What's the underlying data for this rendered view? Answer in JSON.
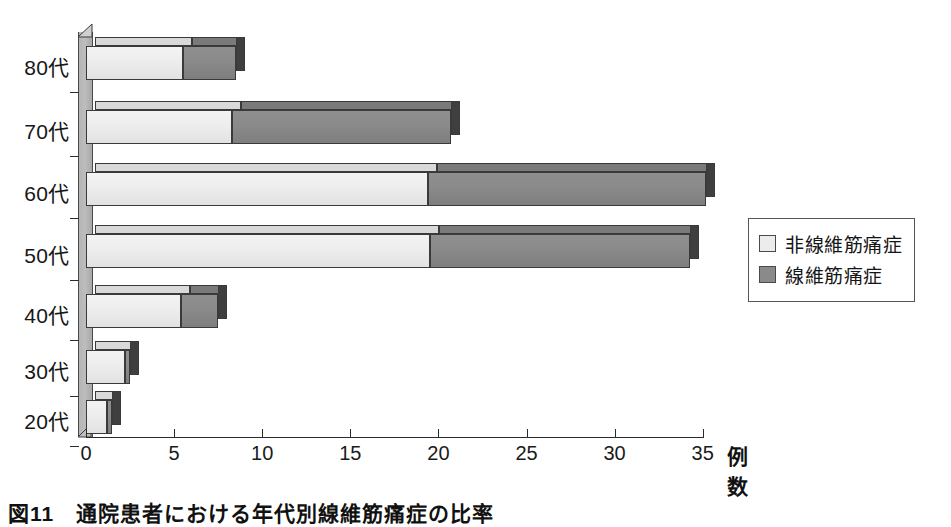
{
  "figure": {
    "caption": "図11　通院患者における年代別線維筋痛症の比率"
  },
  "legend": {
    "position": "right",
    "items": [
      {
        "label": "非線維筋痛症",
        "color": "#ececec",
        "swatch": "light-square-icon"
      },
      {
        "label": "線維筋痛症",
        "color": "#8a8a8a",
        "swatch": "dark-square-icon"
      }
    ]
  },
  "axes": {
    "x_title": "例数",
    "x_ticks": [
      "0",
      "5",
      "10",
      "15",
      "20",
      "25",
      "30",
      "35"
    ],
    "y_labels": [
      "80代",
      "70代",
      "60代",
      "50代",
      "40代",
      "30代",
      "20代"
    ]
  },
  "chart_data": {
    "type": "bar",
    "orientation": "horizontal",
    "stacked": true,
    "title": "図11　通院患者における年代別線維筋痛症の比率",
    "xlabel": "例数",
    "ylabel": "",
    "xlim": [
      0,
      35
    ],
    "xticks": [
      0,
      5,
      10,
      15,
      20,
      25,
      30,
      35
    ],
    "grid": false,
    "legend_position": "right",
    "categories": [
      "80代",
      "70代",
      "60代",
      "50代",
      "40代",
      "30代",
      "20代"
    ],
    "series": [
      {
        "name": "非線維筋痛症",
        "color": "#ececec",
        "values": [
          5.5,
          8.3,
          19.4,
          19.5,
          5.4,
          2.2,
          1.2
        ]
      },
      {
        "name": "線維筋痛症",
        "color": "#8a8a8a",
        "values": [
          3.0,
          12.4,
          15.8,
          14.8,
          2.1,
          0.3,
          0.3
        ]
      }
    ],
    "totals": [
      8.5,
      20.7,
      35.2,
      34.3,
      7.5,
      2.5,
      1.5
    ]
  }
}
